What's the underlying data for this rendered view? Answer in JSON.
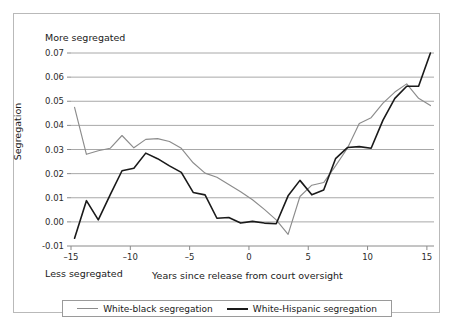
{
  "annotations": {
    "more_segregated": "More segregated",
    "less_segregated": "Less segregated"
  },
  "chart_data": {
    "type": "line",
    "title": "",
    "xlabel": "Years since release from court oversight",
    "ylabel": "Segregation",
    "xlim": [
      -15,
      15.6
    ],
    "ylim": [
      -0.01,
      0.07
    ],
    "xticks": [
      -15,
      -10,
      -5,
      0,
      5,
      10,
      15
    ],
    "xtick_labels": [
      "–15",
      "–10",
      "–5",
      "0",
      "5",
      "10",
      "15"
    ],
    "yticks": [
      -0.01,
      0.0,
      0.01,
      0.02,
      0.03,
      0.04,
      0.05,
      0.06,
      0.07
    ],
    "ytick_labels": [
      "-0.01",
      "0.00",
      "0.01",
      "0.02",
      "0.03",
      "0.04",
      "0.05",
      "0.06",
      "0.07"
    ],
    "grid": "horizontal",
    "legend_position": "bottom",
    "colors": {
      "white_black": "#8c8c8c",
      "white_hispanic": "#1a1a1a",
      "grid": "#a8a8a8",
      "axis": "#8a8a8a",
      "frame": "#b9b9b9"
    },
    "series": [
      {
        "name": "White-black segregation",
        "color": "#8c8c8c",
        "x": [
          -14.7,
          -13.7,
          -12.7,
          -11.7,
          -10.7,
          -9.7,
          -8.7,
          -7.7,
          -6.7,
          -5.7,
          -4.7,
          -3.7,
          -2.7,
          -1.7,
          -0.7,
          0.3,
          1.3,
          2.3,
          3.3,
          4.3,
          5.3,
          6.3,
          7.3,
          8.3,
          9.3,
          10.3,
          11.3,
          12.3,
          13.3,
          14.3,
          15.3
        ],
        "y": [
          0.0475,
          0.028,
          0.0295,
          0.0305,
          0.0358,
          0.0307,
          0.0342,
          0.0345,
          0.0333,
          0.0305,
          0.0245,
          0.0202,
          0.0185,
          0.0155,
          0.0125,
          0.0092,
          0.0052,
          0.0008,
          -0.0052,
          0.0105,
          0.0152,
          0.0163,
          0.0232,
          0.0305,
          0.0408,
          0.0432,
          0.0492,
          0.0538,
          0.0572,
          0.0512,
          0.0482
        ]
      },
      {
        "name": "White-Hispanic segregation",
        "color": "#1a1a1a",
        "x": [
          -14.7,
          -13.7,
          -12.7,
          -11.7,
          -10.7,
          -9.7,
          -8.7,
          -7.7,
          -6.7,
          -5.7,
          -4.7,
          -3.7,
          -2.7,
          -1.7,
          -0.7,
          0.3,
          1.3,
          2.3,
          3.3,
          4.3,
          5.3,
          6.3,
          7.3,
          8.3,
          9.3,
          10.3,
          11.3,
          12.3,
          13.3,
          14.3,
          15.3
        ],
        "y": [
          -0.0068,
          0.0088,
          0.0008,
          0.0112,
          0.0212,
          0.0222,
          0.0285,
          0.0262,
          0.0232,
          0.0205,
          0.0122,
          0.0112,
          0.0015,
          0.0018,
          -0.0005,
          0.0002,
          -0.0005,
          -0.0008,
          0.0108,
          0.0172,
          0.0112,
          0.0132,
          0.0262,
          0.0308,
          0.0312,
          0.0305,
          0.0422,
          0.0512,
          0.0562,
          0.0562,
          0.07
        ]
      }
    ],
    "legend": [
      {
        "label": "White-black segregation",
        "color": "#8c8c8c"
      },
      {
        "label": "White-Hispanic segregation",
        "color": "#1a1a1a"
      }
    ]
  }
}
